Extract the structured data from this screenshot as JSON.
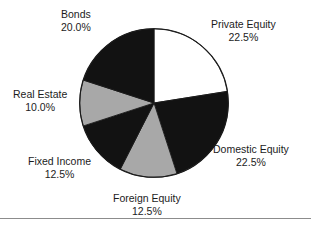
{
  "figure": {
    "background_color": "#ffffff",
    "text_color": "#1c1c1c",
    "rule_color": "#8c8c8c"
  },
  "chart_data": {
    "type": "pie",
    "title": "",
    "xlabel": "",
    "ylabel": "",
    "legend_position": "none",
    "grid": false,
    "start_angle_deg": 0,
    "direction": "clockwise",
    "value_unit": "percent",
    "categories": [
      "Private Equity",
      "Domestic Equity",
      "Foreign Equity",
      "Fixed Income",
      "Real Estate",
      "Bonds"
    ],
    "values": [
      22.5,
      22.5,
      12.5,
      12.5,
      10.0,
      20.0
    ],
    "value_labels": [
      "22.5%",
      "22.5%",
      "12.5%",
      "12.5%",
      "10.0%",
      "20.0%"
    ],
    "slice_colors": [
      "#ffffff",
      "#121212",
      "#a8a8a8",
      "#121212",
      "#a8a8a8",
      "#121212"
    ],
    "slices": [
      {
        "name": "Private Equity",
        "value": 22.5,
        "value_label": "22.5%",
        "color": "#ffffff",
        "start_angle_deg": 0.0,
        "end_angle_deg": 81.0
      },
      {
        "name": "Domestic Equity",
        "value": 22.5,
        "value_label": "22.5%",
        "color": "#121212",
        "start_angle_deg": 81.0,
        "end_angle_deg": 162.0
      },
      {
        "name": "Foreign Equity",
        "value": 12.5,
        "value_label": "12.5%",
        "color": "#a8a8a8",
        "start_angle_deg": 162.0,
        "end_angle_deg": 207.0
      },
      {
        "name": "Fixed Income",
        "value": 12.5,
        "value_label": "12.5%",
        "color": "#121212",
        "start_angle_deg": 207.0,
        "end_angle_deg": 252.0
      },
      {
        "name": "Real Estate",
        "value": 10.0,
        "value_label": "10.0%",
        "color": "#a8a8a8",
        "start_angle_deg": 252.0,
        "end_angle_deg": 288.0
      },
      {
        "name": "Bonds",
        "value": 20.0,
        "value_label": "20.0%",
        "color": "#121212",
        "start_angle_deg": 288.0,
        "end_angle_deg": 360.0
      }
    ]
  }
}
